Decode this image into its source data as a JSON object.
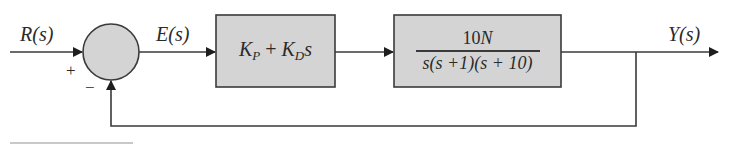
{
  "diagram": {
    "type": "feedback-control-block-diagram",
    "signals": {
      "input": "R(s)",
      "error": "E(s)",
      "output": "Y(s)"
    },
    "summing_junction": {
      "plus_sign": "+",
      "minus_sign": "−"
    },
    "controller_block": {
      "kp_base": "K",
      "kp_sub": "P",
      "plus": "+",
      "kd_base": "K",
      "kd_sub": "D",
      "kd_var": "s"
    },
    "plant_block": {
      "numerator_coeff": "10",
      "numerator_var": "N",
      "denominator": "s(s +1)(s + 10)"
    },
    "colors": {
      "block_fill": "#d4d4d4",
      "line": "#3a3a3a",
      "background": "#ffffff"
    }
  }
}
